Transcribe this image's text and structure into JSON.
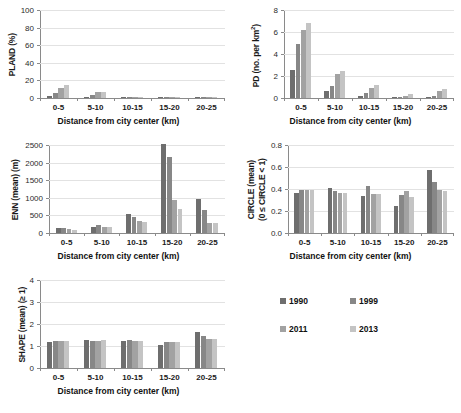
{
  "legend": {
    "position": "bottom-right",
    "entries": [
      {
        "label": "1990",
        "color": "#6e6e6e"
      },
      {
        "label": "1999",
        "color": "#878787"
      },
      {
        "label": "2011",
        "color": "#a2a2a2"
      },
      {
        "label": "2013",
        "color": "#c4c4c4"
      }
    ]
  },
  "shared": {
    "xlabel_prefix": "Distance from city center",
    "xlabel_unit": "(km)",
    "categories": [
      "0-5",
      "5-10",
      "10-15",
      "15-20",
      "20-25"
    ]
  },
  "chart_data": [
    {
      "id": "pland",
      "type": "bar",
      "title": "",
      "ylabel": "PLAND (%)",
      "xlabel": "Distance from city center (km)",
      "categories": [
        "0-5",
        "5-10",
        "10-15",
        "15-20",
        "20-25"
      ],
      "yticks": [
        0,
        20,
        40,
        60,
        80,
        100
      ],
      "ylim": [
        0,
        100
      ],
      "grid": true,
      "legend_position": "none",
      "series": [
        {
          "name": "1990",
          "color": "#6e6e6e",
          "values": [
            2.0,
            1.0,
            0.4,
            0.15,
            0.3
          ]
        },
        {
          "name": "1999",
          "color": "#878787",
          "values": [
            5.5,
            3.0,
            0.9,
            0.2,
            0.5
          ]
        },
        {
          "name": "2011",
          "color": "#a2a2a2",
          "values": [
            11.5,
            6.5,
            1.3,
            0.3,
            0.8
          ]
        },
        {
          "name": "2013",
          "color": "#c4c4c4",
          "values": [
            15.0,
            7.0,
            1.5,
            0.35,
            0.9
          ]
        }
      ]
    },
    {
      "id": "pd",
      "type": "bar",
      "title": "",
      "ylabel": "PD (no. per km2)",
      "ylabel_display": "PD (no. per km²)",
      "xlabel": "Distance from city center (km)",
      "categories": [
        "0-5",
        "5-10",
        "10-15",
        "15-20",
        "20-25"
      ],
      "yticks": [
        0,
        2,
        4,
        6,
        8
      ],
      "ylim": [
        0,
        8
      ],
      "grid": true,
      "legend_position": "none",
      "series": [
        {
          "name": "1990",
          "color": "#6e6e6e",
          "values": [
            2.55,
            0.6,
            0.15,
            0.03,
            0.1
          ]
        },
        {
          "name": "1999",
          "color": "#878787",
          "values": [
            4.95,
            1.05,
            0.45,
            0.1,
            0.2
          ]
        },
        {
          "name": "2011",
          "color": "#a2a2a2",
          "values": [
            6.15,
            2.15,
            0.9,
            0.2,
            0.6
          ]
        },
        {
          "name": "2013",
          "color": "#c4c4c4",
          "values": [
            6.85,
            2.45,
            1.15,
            0.35,
            0.8
          ]
        }
      ]
    },
    {
      "id": "enn",
      "type": "bar",
      "title": "",
      "ylabel": "ENN (mean) (m)",
      "xlabel": "Distance from city center (km)",
      "categories": [
        "0-5",
        "5-10",
        "10-15",
        "15-20",
        "20-25"
      ],
      "yticks": [
        0,
        500,
        1000,
        1500,
        2000,
        2500
      ],
      "ylim": [
        0,
        2500
      ],
      "grid": true,
      "legend_position": "none",
      "series": [
        {
          "name": "1990",
          "color": "#6e6e6e",
          "values": [
            130,
            185,
            530,
            2520,
            975
          ]
        },
        {
          "name": "1999",
          "color": "#878787",
          "values": [
            155,
            215,
            465,
            2160,
            660
          ]
        },
        {
          "name": "2011",
          "color": "#a2a2a2",
          "values": [
            100,
            165,
            340,
            930,
            275
          ]
        },
        {
          "name": "2013",
          "color": "#c4c4c4",
          "values": [
            80,
            165,
            300,
            680,
            285
          ]
        }
      ]
    },
    {
      "id": "circle",
      "type": "bar",
      "title": "",
      "ylabel_line1": "CIRCLE (mean)",
      "ylabel_line2": "(0 ≤ CIRCLE < 1)",
      "xlabel": "Distance from city center (km)",
      "categories": [
        "0-5",
        "5-10",
        "10-15",
        "15-20",
        "20-25"
      ],
      "yticks": [
        "0.0",
        "0.2",
        "0.4",
        "0.6",
        "0.8"
      ],
      "ylim": [
        0,
        0.8
      ],
      "grid": true,
      "legend_position": "none",
      "series": [
        {
          "name": "1990",
          "color": "#6e6e6e",
          "values": [
            0.36,
            0.41,
            0.34,
            0.25,
            0.57
          ]
        },
        {
          "name": "1999",
          "color": "#878787",
          "values": [
            0.39,
            0.38,
            0.43,
            0.345,
            0.465
          ]
        },
        {
          "name": "2011",
          "color": "#a2a2a2",
          "values": [
            0.39,
            0.36,
            0.355,
            0.385,
            0.39
          ]
        },
        {
          "name": "2013",
          "color": "#c4c4c4",
          "values": [
            0.39,
            0.36,
            0.355,
            0.33,
            0.385
          ]
        }
      ]
    },
    {
      "id": "shape",
      "type": "bar",
      "title": "",
      "ylabel": "SHAPE (mean) (≥ 1)",
      "xlabel": "Distance from city center (km)",
      "categories": [
        "0-5",
        "5-10",
        "10-15",
        "15-20",
        "20-25"
      ],
      "yticks": [
        0,
        1,
        2,
        3,
        4
      ],
      "ylim": [
        0,
        4
      ],
      "grid": true,
      "legend_position": "none",
      "series": [
        {
          "name": "1990",
          "color": "#6e6e6e",
          "values": [
            1.17,
            1.27,
            1.25,
            1.05,
            1.62
          ]
        },
        {
          "name": "1999",
          "color": "#878787",
          "values": [
            1.25,
            1.25,
            1.26,
            1.17,
            1.47
          ]
        },
        {
          "name": "2011",
          "color": "#a2a2a2",
          "values": [
            1.25,
            1.23,
            1.25,
            1.17,
            1.33
          ]
        },
        {
          "name": "2013",
          "color": "#c4c4c4",
          "values": [
            1.25,
            1.27,
            1.23,
            1.17,
            1.3
          ]
        }
      ]
    }
  ]
}
